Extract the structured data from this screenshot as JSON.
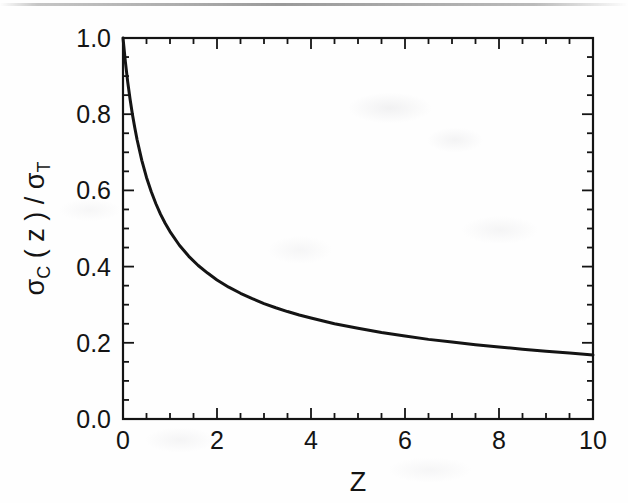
{
  "figure": {
    "background_color": "#fefefe",
    "ink_color": "#141414",
    "artifact": "scanned-page-streak"
  },
  "chart_data": {
    "type": "line",
    "title": "",
    "subtitle": "",
    "xlabel": "Z",
    "ylabel": "σC ( z ) / σT",
    "ylabel_parts": {
      "sigma": "σ",
      "sub_c": "C",
      "open_paren": "( z )",
      "slash": "/",
      "sigma2": "σ",
      "sub_t": "T"
    },
    "xlim": [
      0,
      10
    ],
    "ylim": [
      0.0,
      1.0
    ],
    "grid": false,
    "legend": "none",
    "x_major_ticks": [
      0,
      2,
      4,
      6,
      8,
      10
    ],
    "x_major_tick_labels": [
      "0",
      "2",
      "4",
      "6",
      "8",
      "10"
    ],
    "x_minor_tick_step": 0.5,
    "y_major_ticks": [
      0.0,
      0.2,
      0.4,
      0.6,
      0.8,
      1.0
    ],
    "y_major_tick_labels": [
      "0.0",
      "0.2",
      "0.4",
      "0.6",
      "0.8",
      "1.0"
    ],
    "y_minor_tick_step": 0.05,
    "tick_direction": "in",
    "frame": "box",
    "series": [
      {
        "name": "sigma_C / sigma_T",
        "line_color": "#141414",
        "line_width": 3.0,
        "x": [
          0.0,
          0.05,
          0.1,
          0.15,
          0.2,
          0.25,
          0.3,
          0.4,
          0.5,
          0.6,
          0.7,
          0.8,
          0.9,
          1.0,
          1.2,
          1.4,
          1.6,
          1.8,
          2.0,
          2.25,
          2.5,
          2.75,
          3.0,
          3.25,
          3.5,
          3.75,
          4.0,
          4.5,
          5.0,
          5.5,
          6.0,
          6.5,
          7.0,
          7.5,
          8.0,
          8.5,
          9.0,
          9.5,
          10.0
        ],
        "y": [
          1.0,
          0.938,
          0.885,
          0.84,
          0.8,
          0.765,
          0.733,
          0.679,
          0.634,
          0.597,
          0.565,
          0.537,
          0.513,
          0.492,
          0.456,
          0.427,
          0.403,
          0.383,
          0.365,
          0.346,
          0.33,
          0.316,
          0.303,
          0.292,
          0.282,
          0.273,
          0.265,
          0.25,
          0.238,
          0.227,
          0.218,
          0.209,
          0.202,
          0.195,
          0.189,
          0.183,
          0.178,
          0.173,
          0.168
        ]
      }
    ],
    "annotations": []
  },
  "geometry": {
    "plot_left_px": 123,
    "plot_right_px": 593,
    "plot_top_px": 38,
    "plot_bottom_px": 419
  }
}
